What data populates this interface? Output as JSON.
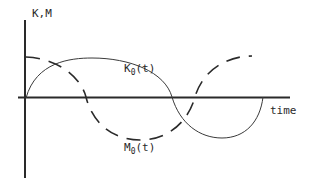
{
  "diagram": {
    "y_axis_label": "K,M",
    "x_axis_label": "time",
    "curves": [
      {
        "name": "K",
        "subscript": "0",
        "arg": "(t)",
        "style": "solid"
      },
      {
        "name": "M",
        "subscript": "0",
        "arg": "(t)",
        "style": "dashed"
      }
    ],
    "colors": {
      "ink": "#2a2a2a",
      "background": "#ffffff"
    }
  }
}
